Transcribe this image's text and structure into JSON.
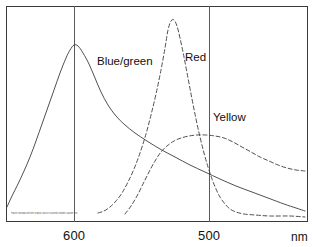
{
  "chart_data": {
    "type": "line",
    "title": "",
    "subtitle": "",
    "xlabel": "nm",
    "ylabel": "",
    "xlim": [
      640,
      460
    ],
    "ylim": [
      0,
      1
    ],
    "x_axis_direction": "decreasing",
    "grid": "vertical-only",
    "gridlines_x": [
      600,
      500
    ],
    "xticks": [
      600,
      500
    ],
    "xtick_labels": [
      "600",
      "500"
    ],
    "legend_position": "inline-annotations",
    "frame": {
      "left": 6,
      "top": 6,
      "right": 308,
      "bottom": 222
    },
    "series": [
      {
        "name": "Blue/green",
        "style": "solid",
        "color": "#3c3c3c",
        "peak_nm": 600,
        "peak_value": 1.0,
        "label_position": {
          "x": 97,
          "y": 56
        },
        "points_px": [
          [
            7,
            207
          ],
          [
            12,
            196
          ],
          [
            18,
            184
          ],
          [
            24,
            171
          ],
          [
            30,
            157
          ],
          [
            36,
            141
          ],
          [
            42,
            124
          ],
          [
            48,
            107
          ],
          [
            54,
            90
          ],
          [
            60,
            73
          ],
          [
            66,
            58
          ],
          [
            70,
            50
          ],
          [
            74,
            45
          ],
          [
            78,
            46
          ],
          [
            83,
            53
          ],
          [
            89,
            64
          ],
          [
            95,
            78
          ],
          [
            101,
            92
          ],
          [
            108,
            105
          ],
          [
            116,
            116
          ],
          [
            125,
            125
          ],
          [
            135,
            133
          ],
          [
            147,
            141
          ],
          [
            160,
            149
          ],
          [
            175,
            157
          ],
          [
            190,
            165
          ],
          [
            205,
            172
          ],
          [
            220,
            179
          ],
          [
            236,
            186
          ],
          [
            252,
            192
          ],
          [
            268,
            198
          ],
          [
            284,
            204
          ],
          [
            296,
            208
          ],
          [
            305,
            211
          ]
        ]
      },
      {
        "name": "Red",
        "style": "dashed",
        "color": "#3c3c3c",
        "peak_nm": 533,
        "peak_value": 1.0,
        "label_position": {
          "x": 185,
          "y": 52
        },
        "points_px": [
          [
            98,
            213
          ],
          [
            104,
            211
          ],
          [
            110,
            207
          ],
          [
            116,
            201
          ],
          [
            122,
            193
          ],
          [
            128,
            182
          ],
          [
            134,
            169
          ],
          [
            140,
            153
          ],
          [
            146,
            134
          ],
          [
            151,
            115
          ],
          [
            156,
            94
          ],
          [
            161,
            70
          ],
          [
            165,
            48
          ],
          [
            168,
            30
          ],
          [
            171,
            21
          ],
          [
            174,
            20
          ],
          [
            177,
            26
          ],
          [
            180,
            38
          ],
          [
            184,
            57
          ],
          [
            188,
            78
          ],
          [
            192,
            99
          ],
          [
            196,
            119
          ],
          [
            200,
            137
          ],
          [
            204,
            153
          ],
          [
            208,
            167
          ],
          [
            212,
            179
          ],
          [
            216,
            189
          ],
          [
            220,
            197
          ],
          [
            225,
            204
          ],
          [
            230,
            209
          ],
          [
            236,
            212
          ],
          [
            244,
            214
          ],
          [
            255,
            215
          ],
          [
            270,
            216
          ],
          [
            290,
            216
          ],
          [
            305,
            217
          ]
        ]
      },
      {
        "name": "Yellow",
        "style": "dashed",
        "color": "#3c3c3c",
        "peak_nm": 498,
        "peak_value": 0.42,
        "label_position": {
          "x": 213,
          "y": 112
        },
        "points_px": [
          [
            125,
            214
          ],
          [
            131,
            206
          ],
          [
            137,
            196
          ],
          [
            143,
            184
          ],
          [
            149,
            172
          ],
          [
            155,
            161
          ],
          [
            161,
            152
          ],
          [
            167,
            146
          ],
          [
            174,
            141
          ],
          [
            181,
            138
          ],
          [
            189,
            136
          ],
          [
            197,
            135
          ],
          [
            206,
            135
          ],
          [
            215,
            136
          ],
          [
            224,
            138
          ],
          [
            233,
            142
          ],
          [
            242,
            147
          ],
          [
            251,
            152
          ],
          [
            260,
            157
          ],
          [
            269,
            161
          ],
          [
            278,
            165
          ],
          [
            287,
            168
          ],
          [
            296,
            170
          ],
          [
            305,
            171
          ]
        ]
      }
    ]
  },
  "axis": {
    "ticks": [
      {
        "label": "600",
        "x_px": 74
      },
      {
        "label": "500",
        "x_px": 209
      }
    ],
    "unit_label": "nm",
    "unit_x_px": 291
  },
  "annotations": {
    "micro_caption": "Figure reproduced from original source scanned illegible caption text"
  }
}
